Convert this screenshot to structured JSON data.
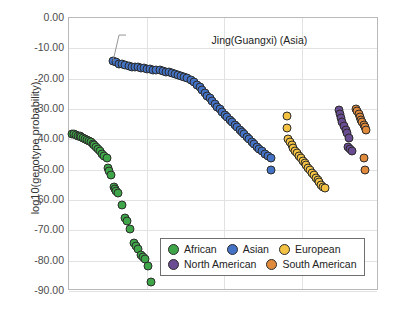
{
  "chart_data": {
    "type": "scatter",
    "title": "",
    "xlabel": "",
    "ylabel": "log10(genotype probability)",
    "ylim": [
      -90,
      0
    ],
    "yticks": [
      "0.00",
      "-10.00",
      "-20.00",
      "-30.00",
      "-40.00",
      "-50.00",
      "-60.00",
      "-70.00",
      "-80.00",
      "-90.00"
    ],
    "xlim": [
      0,
      100
    ],
    "xticks": [],
    "grid": "horizontal-and-vertical",
    "legend_position": "bottom-center",
    "annotations": [
      {
        "text": "Jing(Guangxi) (Asia)",
        "x": 46,
        "y": -7.5,
        "leader_to_x": 14.2,
        "leader_to_y": -14.2
      }
    ],
    "legend": [
      {
        "name": "African",
        "color": "#3EA648"
      },
      {
        "name": "Asian",
        "color": "#4472C4"
      },
      {
        "name": "European",
        "color": "#F3C242"
      },
      {
        "name": "North American",
        "color": "#6A4C93"
      },
      {
        "name": "South American",
        "color": "#E08A3C"
      }
    ],
    "series": [
      {
        "name": "African",
        "color": "#3EA648",
        "points": [
          [
            1.0,
            -38.2
          ],
          [
            1.6,
            -38.4
          ],
          [
            2.2,
            -38.6
          ],
          [
            2.8,
            -38.8
          ],
          [
            3.4,
            -39.0
          ],
          [
            4.0,
            -39.3
          ],
          [
            4.6,
            -39.6
          ],
          [
            5.2,
            -39.9
          ],
          [
            5.8,
            -40.2
          ],
          [
            6.4,
            -40.6
          ],
          [
            7.0,
            -41.0
          ],
          [
            7.6,
            -41.5
          ],
          [
            8.2,
            -42.0
          ],
          [
            8.8,
            -42.6
          ],
          [
            9.4,
            -43.3
          ],
          [
            10.0,
            -44.0
          ],
          [
            10.6,
            -44.8
          ],
          [
            11.4,
            -45.6
          ],
          [
            12.2,
            -46.2
          ],
          [
            12.6,
            -49.6
          ],
          [
            13.0,
            -50.4
          ],
          [
            13.6,
            -51.6
          ],
          [
            14.4,
            -55.6
          ],
          [
            14.8,
            -56.4
          ],
          [
            15.2,
            -57.0
          ],
          [
            15.8,
            -57.6
          ],
          [
            17.0,
            -61.8
          ],
          [
            18.2,
            -66.0
          ],
          [
            18.8,
            -67.0
          ],
          [
            19.6,
            -69.6
          ],
          [
            21.0,
            -74.2
          ],
          [
            21.6,
            -75.0
          ],
          [
            22.4,
            -76.0
          ],
          [
            23.2,
            -78.2
          ],
          [
            23.8,
            -78.8
          ],
          [
            24.6,
            -79.4
          ],
          [
            25.4,
            -81.6
          ],
          [
            26.6,
            -87.0
          ]
        ]
      },
      {
        "name": "Asian",
        "color": "#4472C4",
        "points": [
          [
            14.2,
            -14.2
          ],
          [
            15.2,
            -14.6
          ],
          [
            16.2,
            -15.0
          ],
          [
            17.2,
            -15.3
          ],
          [
            18.2,
            -15.6
          ],
          [
            19.2,
            -15.8
          ],
          [
            20.2,
            -16.0
          ],
          [
            21.2,
            -16.2
          ],
          [
            22.2,
            -16.3
          ],
          [
            23.2,
            -16.5
          ],
          [
            24.2,
            -16.6
          ],
          [
            25.2,
            -16.8
          ],
          [
            26.2,
            -16.9
          ],
          [
            27.2,
            -17.0
          ],
          [
            28.2,
            -17.2
          ],
          [
            29.2,
            -17.3
          ],
          [
            30.2,
            -17.5
          ],
          [
            31.2,
            -17.7
          ],
          [
            32.2,
            -17.9
          ],
          [
            33.2,
            -18.1
          ],
          [
            34.2,
            -18.4
          ],
          [
            35.2,
            -18.7
          ],
          [
            36.2,
            -19.0
          ],
          [
            37.2,
            -19.4
          ],
          [
            38.2,
            -19.9
          ],
          [
            39.2,
            -20.5
          ],
          [
            40.2,
            -21.2
          ],
          [
            41.2,
            -22.0
          ],
          [
            42.2,
            -22.9
          ],
          [
            43.0,
            -23.8
          ],
          [
            43.8,
            -24.7
          ],
          [
            44.6,
            -25.6
          ],
          [
            45.4,
            -26.5
          ],
          [
            46.2,
            -27.4
          ],
          [
            47.0,
            -28.3
          ],
          [
            47.8,
            -29.2
          ],
          [
            48.6,
            -30.1
          ],
          [
            49.4,
            -31.0
          ],
          [
            50.2,
            -31.9
          ],
          [
            51.0,
            -32.8
          ],
          [
            51.8,
            -33.6
          ],
          [
            52.6,
            -34.4
          ],
          [
            53.4,
            -35.2
          ],
          [
            54.2,
            -36.0
          ],
          [
            55.0,
            -36.8
          ],
          [
            55.8,
            -37.6
          ],
          [
            56.6,
            -38.4
          ],
          [
            57.4,
            -39.2
          ],
          [
            58.2,
            -40.0
          ],
          [
            59.0,
            -40.8
          ],
          [
            59.8,
            -41.6
          ],
          [
            60.6,
            -42.4
          ],
          [
            61.4,
            -43.2
          ],
          [
            62.2,
            -44.0
          ],
          [
            63.2,
            -44.8
          ],
          [
            64.2,
            -45.6
          ],
          [
            65.2,
            -46.0
          ],
          [
            65.0,
            -50.2
          ]
        ]
      },
      {
        "name": "European",
        "color": "#F3C242",
        "points": [
          [
            70.4,
            -32.4
          ],
          [
            70.4,
            -36.4
          ],
          [
            70.6,
            -39.8
          ],
          [
            71.2,
            -40.8
          ],
          [
            71.8,
            -41.8
          ],
          [
            72.4,
            -42.8
          ],
          [
            73.0,
            -43.8
          ],
          [
            73.6,
            -44.6
          ],
          [
            74.2,
            -45.4
          ],
          [
            74.8,
            -46.2
          ],
          [
            75.4,
            -47.0
          ],
          [
            76.0,
            -47.8
          ],
          [
            76.6,
            -48.6
          ],
          [
            77.2,
            -49.4
          ],
          [
            77.8,
            -50.2
          ],
          [
            78.4,
            -51.0
          ],
          [
            79.0,
            -51.8
          ],
          [
            79.6,
            -52.6
          ],
          [
            80.2,
            -53.4
          ],
          [
            80.8,
            -54.2
          ],
          [
            81.4,
            -55.0
          ],
          [
            82.0,
            -55.8
          ],
          [
            82.6,
            -56.2
          ]
        ]
      },
      {
        "name": "North American",
        "color": "#6A4C93",
        "points": [
          [
            87.0,
            -30.2
          ],
          [
            87.4,
            -31.6
          ],
          [
            87.8,
            -33.0
          ],
          [
            88.2,
            -34.4
          ],
          [
            88.6,
            -35.6
          ],
          [
            89.2,
            -36.8
          ],
          [
            89.8,
            -38.0
          ],
          [
            90.2,
            -39.4
          ],
          [
            90.0,
            -42.4
          ],
          [
            90.6,
            -43.2
          ],
          [
            91.4,
            -43.8
          ]
        ]
      },
      {
        "name": "South American",
        "color": "#E08A3C",
        "points": [
          [
            92.6,
            -30.0
          ],
          [
            93.0,
            -30.8
          ],
          [
            93.4,
            -31.8
          ],
          [
            93.8,
            -32.8
          ],
          [
            94.2,
            -33.6
          ],
          [
            94.6,
            -34.4
          ],
          [
            95.0,
            -35.2
          ],
          [
            95.4,
            -36.0
          ],
          [
            95.8,
            -36.8
          ],
          [
            95.2,
            -46.0
          ],
          [
            95.4,
            -50.2
          ]
        ]
      }
    ]
  }
}
